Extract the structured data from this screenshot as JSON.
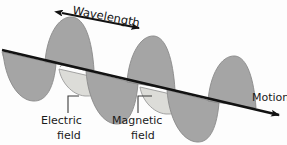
{
  "diagram": {
    "labels": {
      "wavelength": "Wavelength",
      "electric_line1": "Electric",
      "electric_line2": "field",
      "magnetic_line1": "Magnetic",
      "magnetic_line2": "field",
      "motion": "Motion"
    },
    "colors": {
      "electric_wave_fill": "#a5a5a5",
      "magnetic_wave_fill": "#dcdcd8",
      "wave_outline": "#8a8a8a",
      "axis_line": "#121212",
      "text": "#1a1a1a",
      "background": "#fdfdfd",
      "leader_line": "#3c3c3c"
    },
    "geometry": {
      "axis_start_x": 2,
      "axis_start_y": 50,
      "axis_end_x": 281,
      "axis_end_y": 116,
      "wavelength_arrow_start_x": 60,
      "wavelength_arrow_start_y": 12,
      "wavelength_arrow_end_x": 141,
      "wavelength_arrow_end_y": 29,
      "wave_cycles": 3,
      "wavelength_px": 81
    }
  }
}
